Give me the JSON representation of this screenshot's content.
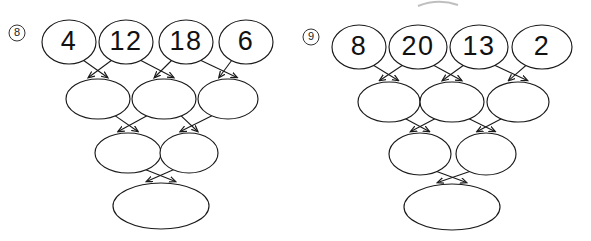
{
  "page": {
    "kind": "math-worksheet",
    "background_color": "#ffffff",
    "ink_color": "#1a1a1a",
    "width": 591,
    "height": 241
  },
  "artifact": {
    "name": "clipped-ellipse-smudge",
    "visible": true
  },
  "problems": [
    {
      "number": "8",
      "origin_x": 0,
      "rows": [
        {
          "row_index": 0,
          "cells": [
            {
              "value": "4",
              "cx": 69,
              "cy": 42,
              "rx": 27,
              "ry": 22,
              "filled": true
            },
            {
              "value": "12",
              "cx": 126,
              "cy": 42,
              "rx": 27,
              "ry": 22,
              "filled": true
            },
            {
              "value": "18",
              "cx": 186,
              "cy": 42,
              "rx": 27,
              "ry": 22,
              "filled": true
            },
            {
              "value": "6",
              "cx": 246,
              "cy": 42,
              "rx": 27,
              "ry": 22,
              "filled": true
            }
          ]
        },
        {
          "row_index": 1,
          "cells": [
            {
              "value": "",
              "cx": 98,
              "cy": 99,
              "rx": 32,
              "ry": 20,
              "filled": false
            },
            {
              "value": "",
              "cx": 164,
              "cy": 99,
              "rx": 32,
              "ry": 20,
              "filled": false
            },
            {
              "value": "",
              "cx": 228,
              "cy": 99,
              "rx": 30,
              "ry": 20,
              "filled": false
            }
          ]
        },
        {
          "row_index": 2,
          "cells": [
            {
              "value": "",
              "cx": 128,
              "cy": 153,
              "rx": 33,
              "ry": 20,
              "filled": false
            },
            {
              "value": "",
              "cx": 189,
              "cy": 153,
              "rx": 29,
              "ry": 20,
              "filled": false
            }
          ]
        },
        {
          "row_index": 3,
          "cells": [
            {
              "value": "",
              "cx": 161,
              "cy": 206,
              "rx": 48,
              "ry": 23,
              "filled": false
            }
          ]
        }
      ],
      "badge": {
        "cx": 17,
        "cy": 33,
        "r": 8
      }
    },
    {
      "number": "9",
      "origin_x": 295,
      "rows": [
        {
          "row_index": 0,
          "cells": [
            {
              "value": "8",
              "cx": 359,
              "cy": 47,
              "rx": 27,
              "ry": 22,
              "filled": true
            },
            {
              "value": "20",
              "cx": 418,
              "cy": 47,
              "rx": 29,
              "ry": 22,
              "filled": true
            },
            {
              "value": "13",
              "cx": 479,
              "cy": 47,
              "rx": 29,
              "ry": 22,
              "filled": true
            },
            {
              "value": "2",
              "cx": 542,
              "cy": 47,
              "rx": 30,
              "ry": 22,
              "filled": true
            }
          ]
        },
        {
          "row_index": 1,
          "cells": [
            {
              "value": "",
              "cx": 389,
              "cy": 102,
              "rx": 31,
              "ry": 20,
              "filled": false
            },
            {
              "value": "",
              "cx": 452,
              "cy": 102,
              "rx": 32,
              "ry": 20,
              "filled": false
            },
            {
              "value": "",
              "cx": 518,
              "cy": 102,
              "rx": 31,
              "ry": 20,
              "filled": false
            }
          ]
        },
        {
          "row_index": 2,
          "cells": [
            {
              "value": "",
              "cx": 420,
              "cy": 154,
              "rx": 31,
              "ry": 21,
              "filled": false
            },
            {
              "value": "",
              "cx": 486,
              "cy": 154,
              "rx": 30,
              "ry": 21,
              "filled": false
            }
          ]
        },
        {
          "row_index": 3,
          "cells": [
            {
              "value": "",
              "cx": 452,
              "cy": 207,
              "rx": 48,
              "ry": 23,
              "filled": false
            }
          ]
        }
      ],
      "badge": {
        "cx": 311,
        "cy": 37,
        "r": 8
      }
    }
  ]
}
